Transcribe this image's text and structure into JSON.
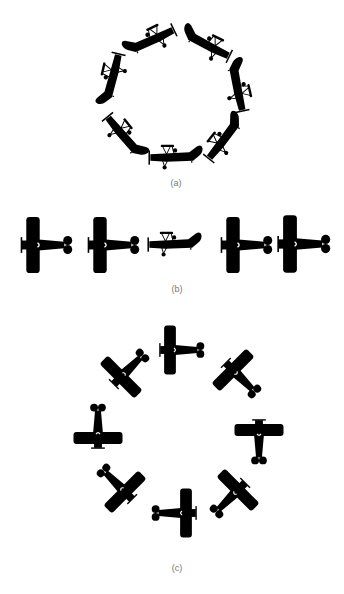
{
  "figure": {
    "panels": [
      {
        "id": "a",
        "caption": "(a)",
        "description": "Seven side-view biplane silhouettes arranged in a ring, each tangent to the circle",
        "view": "side",
        "count": 7,
        "layout": "circle",
        "center": [
          172,
          97
        ],
        "radius": 57
      },
      {
        "id": "b",
        "caption": "(b)",
        "description": "Row of five plane silhouettes: four top-view and one side-view biplane in the middle",
        "view": "mixed",
        "items": [
          "top",
          "top",
          "side",
          "top",
          "top"
        ],
        "layout": "row"
      },
      {
        "id": "c",
        "caption": "(c)",
        "description": "Eight top-view plane silhouettes arranged in a ring at 45 degree increments",
        "view": "top",
        "count": 8,
        "layout": "circle",
        "center": [
          178,
          440
        ],
        "radius": 86
      }
    ],
    "colors": {
      "silhouette": "#000000",
      "background": "#ffffff",
      "caption": "#777777"
    }
  }
}
